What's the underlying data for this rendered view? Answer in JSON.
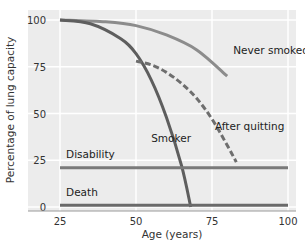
{
  "chart_data": {
    "type": "line",
    "title": "",
    "xlabel": "Age (years)",
    "ylabel": "Percentage of lung capacity",
    "xlim": [
      25,
      100
    ],
    "ylim": [
      0,
      100
    ],
    "x_ticks": [
      "25",
      "50",
      "75",
      "100"
    ],
    "y_ticks": [
      "0",
      "25",
      "50",
      "75",
      "100"
    ],
    "grid": true,
    "legend": "inline labels",
    "series": [
      {
        "name": "Never smoked",
        "style": "solid",
        "color": "#8c8c8c",
        "x": [
          25,
          40,
          50,
          60,
          70,
          80
        ],
        "y": [
          100,
          99,
          97,
          92,
          84,
          70
        ]
      },
      {
        "name": "Smoker",
        "style": "solid",
        "color": "#5e5e5e",
        "x": [
          25,
          35,
          45,
          50,
          55,
          60,
          65,
          68
        ],
        "y": [
          100,
          98,
          90,
          82,
          68,
          48,
          22,
          0
        ]
      },
      {
        "name": "After quitting",
        "style": "dashed",
        "color": "#6e6e6e",
        "x": [
          50,
          55,
          60,
          65,
          70,
          75,
          80,
          83
        ],
        "y": [
          78,
          76,
          72,
          66,
          58,
          47,
          33,
          24
        ]
      },
      {
        "name": "Disability",
        "style": "solid",
        "color": "#7a7a7a",
        "x": [
          25,
          100
        ],
        "y": [
          21,
          21
        ]
      },
      {
        "name": "Death",
        "style": "solid",
        "color": "#6a6a6a",
        "x": [
          25,
          100
        ],
        "y": [
          1,
          1
        ]
      }
    ],
    "annotations": [
      {
        "text": "Never smoked",
        "x": 82,
        "y": 82
      },
      {
        "text": "Smoker",
        "x": 55,
        "y": 35
      },
      {
        "text": "After quitting",
        "x": 76,
        "y": 41
      },
      {
        "text": "Disability",
        "x": 27,
        "y": 26
      },
      {
        "text": "Death",
        "x": 27,
        "y": 6
      }
    ]
  },
  "colors": {
    "plot_bg": "#ececec",
    "grid": "#ffffff",
    "axis": "#999999"
  }
}
